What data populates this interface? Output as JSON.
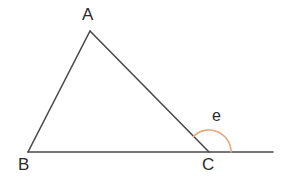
{
  "figure": {
    "background_color": "#ffffff",
    "line_color": "#4a4a4a",
    "arc_color": "#e8a87c",
    "label_color": "#2b2b2b",
    "line_width": 1.6,
    "arc_width": 1.6
  },
  "labels": {
    "vertex_a": "A",
    "vertex_b": "B",
    "vertex_c": "C",
    "angle_e": "e"
  },
  "chart_data": {
    "type": "diagram",
    "points": {
      "A": {
        "x": 90,
        "y": 31
      },
      "B": {
        "x": 28,
        "y": 152
      },
      "C": {
        "x": 209,
        "y": 152
      },
      "D": {
        "x": 273,
        "y": 152
      }
    },
    "segments": [
      {
        "name": "AB",
        "from": "A",
        "to": "B",
        "color": "#4a4a4a"
      },
      {
        "name": "AC",
        "from": "A",
        "to": "C",
        "color": "#4a4a4a"
      },
      {
        "name": "BD",
        "from": "B",
        "to": "D",
        "color": "#4a4a4a"
      }
    ],
    "arcs": [
      {
        "name": "exterior-angle-e",
        "center": "C",
        "radius": 22,
        "from_ray": "CA",
        "to_ray": "CD",
        "label": "e",
        "color": "#e8a87c"
      }
    ],
    "label_positions": {
      "A": {
        "x": 88,
        "y": 14
      },
      "B": {
        "x": 24,
        "y": 165
      },
      "C": {
        "x": 208,
        "y": 165
      },
      "e": {
        "x": 218,
        "y": 117
      }
    }
  }
}
